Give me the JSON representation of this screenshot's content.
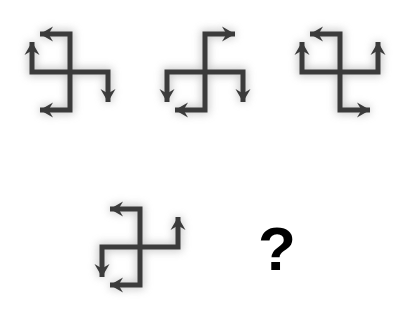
{
  "page": {
    "title": "Arrow Pinwheel Visual Analogy",
    "background_color": "#ffffff",
    "width": 405,
    "height": 318
  },
  "style": {
    "stroke_color": "#3b3b3b",
    "stroke_width": 5,
    "glow_color": "#9a9a9a",
    "glow_blur": 4,
    "question_mark_color": "#000000"
  },
  "puzzle": {
    "type": "visual-analogy",
    "prompt_symbol": "?",
    "figure_count": 4,
    "answer_slot_label": "?"
  },
  "figures": [
    {
      "id": "figure-1",
      "index": 1,
      "label": "Figure 1",
      "center": {
        "x": 70,
        "y": 72
      },
      "arm_length": 38,
      "bend_length": 30,
      "arms": [
        {
          "name": "top-arm",
          "start_dir": "up",
          "end_dir": "left",
          "arrow": "left-arrow"
        },
        {
          "name": "left-arm",
          "start_dir": "left",
          "end_dir": "up",
          "arrow": "up-arrow"
        },
        {
          "name": "right-arm",
          "start_dir": "right",
          "end_dir": "down",
          "arrow": "down-arrow"
        },
        {
          "name": "bottom-arm",
          "start_dir": "down",
          "end_dir": "left",
          "arrow": "left-arrow"
        }
      ]
    },
    {
      "id": "figure-2",
      "index": 2,
      "label": "Figure 2",
      "center": {
        "x": 205,
        "y": 72
      },
      "arm_length": 38,
      "bend_length": 30,
      "arms": [
        {
          "name": "top-arm",
          "start_dir": "up",
          "end_dir": "right",
          "arrow": "right-arrow"
        },
        {
          "name": "left-arm",
          "start_dir": "left",
          "end_dir": "down",
          "arrow": "down-arrow"
        },
        {
          "name": "right-arm",
          "start_dir": "right",
          "end_dir": "down",
          "arrow": "down-arrow"
        },
        {
          "name": "bottom-arm",
          "start_dir": "down",
          "end_dir": "left",
          "arrow": "left-arrow"
        }
      ]
    },
    {
      "id": "figure-3",
      "index": 3,
      "label": "Figure 3",
      "center": {
        "x": 340,
        "y": 72
      },
      "arm_length": 38,
      "bend_length": 30,
      "arms": [
        {
          "name": "top-arm",
          "start_dir": "up",
          "end_dir": "left",
          "arrow": "left-arrow"
        },
        {
          "name": "left-arm",
          "start_dir": "left",
          "end_dir": "up",
          "arrow": "up-arrow"
        },
        {
          "name": "right-arm",
          "start_dir": "right",
          "end_dir": "up",
          "arrow": "up-arrow"
        },
        {
          "name": "bottom-arm",
          "start_dir": "down",
          "end_dir": "right",
          "arrow": "right-arrow"
        }
      ]
    },
    {
      "id": "figure-4",
      "index": 4,
      "label": "Figure 4",
      "center": {
        "x": 140,
        "y": 247
      },
      "arm_length": 38,
      "bend_length": 30,
      "arms": [
        {
          "name": "top-arm",
          "start_dir": "up",
          "end_dir": "left",
          "arrow": "left-arrow"
        },
        {
          "name": "left-arm",
          "start_dir": "left",
          "end_dir": "down",
          "arrow": "down-arrow"
        },
        {
          "name": "right-arm",
          "start_dir": "right",
          "end_dir": "up",
          "arrow": "up-arrow"
        },
        {
          "name": "bottom-arm",
          "start_dir": "down",
          "end_dir": "left",
          "arrow": "left-arrow"
        }
      ]
    }
  ],
  "question_mark": {
    "text": "?",
    "x": 258,
    "y": 218,
    "font_size": 62
  }
}
